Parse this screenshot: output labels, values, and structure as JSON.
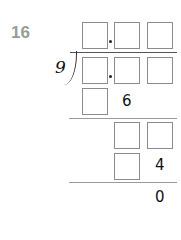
{
  "question": {
    "number": "16"
  },
  "division": {
    "divisor": "9",
    "quotient_boxes": 3,
    "dividend_boxes": 3,
    "steps": [
      {
        "given_digit": "6"
      },
      {
        "given_digit": "4"
      },
      {
        "remainder": "0"
      }
    ]
  }
}
